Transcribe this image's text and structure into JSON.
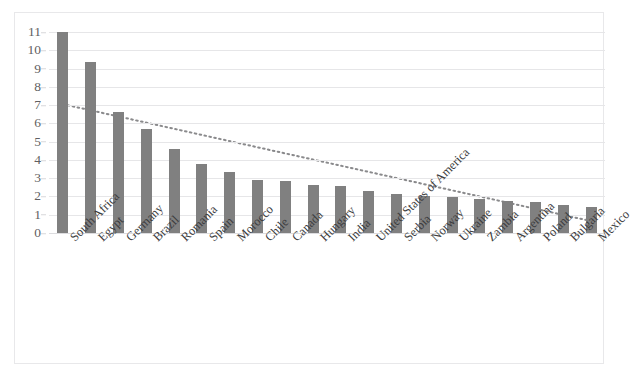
{
  "chart_data": {
    "type": "bar",
    "title": "",
    "subtitle": "",
    "xlabel": "",
    "ylabel": "",
    "ylim": [
      0,
      11
    ],
    "y_ticks": [
      0,
      1,
      2,
      3,
      4,
      5,
      6,
      7,
      8,
      9,
      10,
      11
    ],
    "grid": "horizontal",
    "legend": "none",
    "bar_color": "#808080",
    "categories": [
      "South Africa",
      "Egypt",
      "Germany",
      "Brazil",
      "Romania",
      "Spain",
      "Morocco",
      "Chile",
      "Canada",
      "Hungary",
      "India",
      "United States of America",
      "Serbia",
      "Norway",
      "Ukraine",
      "Zambia",
      "Argentina",
      "Poland",
      "Bulgaria",
      "Mexico"
    ],
    "values": [
      11.0,
      9.35,
      6.65,
      5.7,
      4.6,
      3.75,
      3.35,
      2.9,
      2.85,
      2.65,
      2.55,
      2.3,
      2.15,
      2.05,
      1.95,
      1.85,
      1.75,
      1.7,
      1.55,
      1.4
    ],
    "series": [
      {
        "name": "Values",
        "type": "bar",
        "color": "#808080",
        "values": [
          11.0,
          9.35,
          6.65,
          5.7,
          4.6,
          3.75,
          3.35,
          2.9,
          2.85,
          2.65,
          2.55,
          2.3,
          2.15,
          2.05,
          1.95,
          1.85,
          1.75,
          1.7,
          1.55,
          1.4
        ]
      },
      {
        "name": "Trendline",
        "type": "line",
        "style": "dotted",
        "color": "#8a8a8c",
        "start_value": 7.05,
        "end_value": 0.65
      }
    ]
  }
}
